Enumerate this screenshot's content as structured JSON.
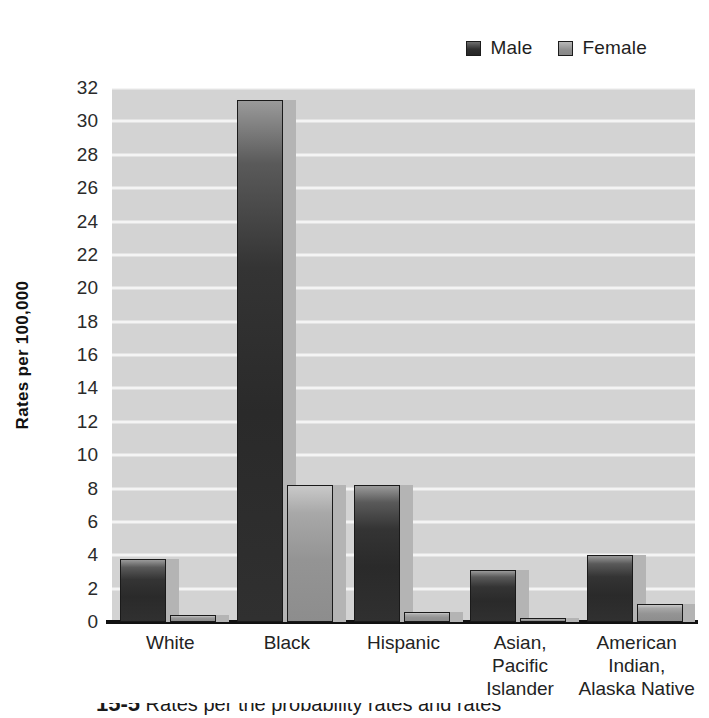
{
  "legend": {
    "position": "top-right",
    "entries": [
      {
        "label": "Male",
        "swatch": "male-swatch",
        "color": "#2f2f2f"
      },
      {
        "label": "Female",
        "swatch": "female-swatch",
        "color": "#8f8f8f"
      }
    ]
  },
  "axes": {
    "ylabel": "Rates per 100,000",
    "yticks": [
      "0",
      "2",
      "4",
      "6",
      "8",
      "10",
      "12",
      "14",
      "16",
      "18",
      "20",
      "22",
      "24",
      "26",
      "28",
      "30",
      "32"
    ]
  },
  "caption": {
    "number": "15-5",
    "text": "Rates per the probability rates and rates"
  },
  "colors": {
    "plot_background": "#d3d3d3",
    "gridline": "#f4f4f4",
    "male_bar": "#2f2f2f",
    "female_bar": "#909090",
    "bar_shadow": "#b4b4b4",
    "axis": "#111111"
  },
  "chart_data": {
    "type": "bar",
    "title": "",
    "xlabel": "",
    "ylabel": "Rates per 100,000",
    "ylim": [
      0,
      32
    ],
    "ytick_step": 2,
    "grid": true,
    "legend_position": "top-right",
    "categories": [
      "White",
      "Black",
      "Hispanic",
      "Asian,\nPacific\nIslander",
      "American\nIndian,\nAlaska Native"
    ],
    "category_lines": [
      [
        "White"
      ],
      [
        "Black"
      ],
      [
        "Hispanic"
      ],
      [
        "Asian,",
        "Pacific",
        "Islander"
      ],
      [
        "American",
        "Indian,",
        "Alaska Native"
      ]
    ],
    "series": [
      {
        "name": "Male",
        "values": [
          3.8,
          31.3,
          8.2,
          3.1,
          4.0
        ]
      },
      {
        "name": "Female",
        "values": [
          0.4,
          8.2,
          0.6,
          0.25,
          1.1
        ]
      }
    ]
  }
}
